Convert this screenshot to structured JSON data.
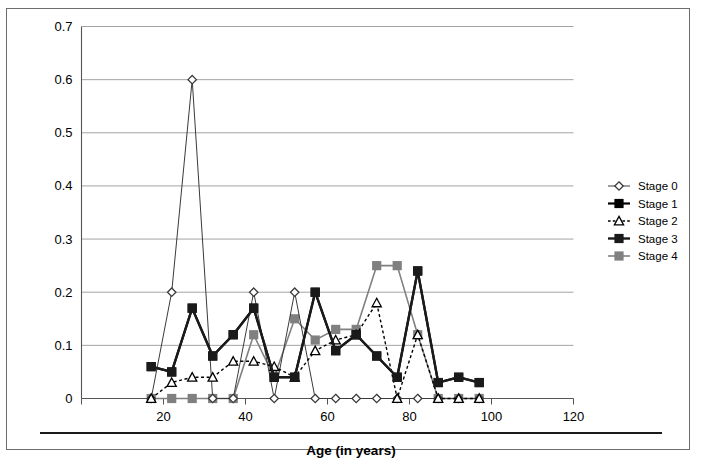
{
  "figure": {
    "background": "#ffffff",
    "border_color": "#6e6e6e"
  },
  "axis_title": "Age (in years)",
  "legend": {
    "position": "right",
    "entries": [
      {
        "label": "Stage 0",
        "marker": "diamond-open",
        "color": "#3a3a3a",
        "line": "solid",
        "width": 1.0
      },
      {
        "label": "Stage 1",
        "marker": "square-filled",
        "color": "#000000",
        "line": "solid",
        "width": 2.2
      },
      {
        "label": "Stage 2",
        "marker": "triangle-open",
        "color": "#000000",
        "line": "dashed",
        "width": 1.4
      },
      {
        "label": "Stage 3",
        "marker": "square-filled",
        "color": "#1a1a1a",
        "line": "solid",
        "width": 2.4
      },
      {
        "label": "Stage 4",
        "marker": "square-filled",
        "color": "#808080",
        "line": "solid",
        "width": 1.6
      }
    ]
  },
  "chart_data": {
    "type": "line",
    "title": "",
    "xlabel": "Age (in years)",
    "ylabel": "",
    "xlim": [
      0,
      120
    ],
    "ylim": [
      0,
      0.7
    ],
    "xticks": [
      0,
      20,
      40,
      60,
      80,
      100,
      120
    ],
    "xtick_labels": [
      "",
      "20",
      "40",
      "60",
      "80",
      "100",
      "120"
    ],
    "yticks": [
      0,
      0.1,
      0.2,
      0.3,
      0.4,
      0.5,
      0.6,
      0.7
    ],
    "ytick_labels": [
      "0",
      "0.1",
      "0.2",
      "0.3",
      "0.4",
      "0.5",
      "0.6",
      "0.7"
    ],
    "grid": "horizontal",
    "grid_color": "#9a9a9a",
    "x": [
      17,
      22,
      27,
      32,
      37,
      42,
      47,
      52,
      57,
      62,
      67,
      72,
      77,
      82,
      87,
      92,
      97
    ],
    "series": [
      {
        "name": "Stage 0",
        "marker": "diamond-open",
        "color": "#3a3a3a",
        "line": "solid",
        "width": 1.0,
        "values": [
          0.0,
          0.2,
          0.6,
          0.0,
          0.0,
          0.2,
          0.0,
          0.2,
          0.0,
          0.0,
          0.0,
          0.0,
          0.0,
          0.0,
          0.0,
          0.0,
          0.0
        ]
      },
      {
        "name": "Stage 1",
        "marker": "square-filled",
        "color": "#000000",
        "line": "solid",
        "width": 2.2,
        "values": [
          0.06,
          0.05,
          0.17,
          0.08,
          0.12,
          0.17,
          0.04,
          0.04,
          0.2,
          0.09,
          0.12,
          0.08,
          0.04,
          0.24,
          0.03,
          0.04,
          0.03
        ]
      },
      {
        "name": "Stage 2",
        "marker": "triangle-open",
        "color": "#000000",
        "line": "dashed",
        "width": 1.4,
        "values": [
          0.0,
          0.03,
          0.04,
          0.04,
          0.07,
          0.07,
          0.06,
          0.04,
          0.09,
          0.11,
          0.12,
          0.18,
          0.0,
          0.12,
          0.0,
          0.0,
          0.0
        ]
      },
      {
        "name": "Stage 3",
        "marker": "square-filled",
        "color": "#1a1a1a",
        "line": "solid",
        "width": 2.4,
        "values": [
          0.06,
          0.05,
          0.17,
          0.08,
          0.12,
          0.17,
          0.04,
          0.04,
          0.2,
          0.09,
          0.12,
          0.08,
          0.04,
          0.24,
          0.03,
          0.04,
          0.03
        ]
      },
      {
        "name": "Stage 4",
        "marker": "square-filled",
        "color": "#808080",
        "line": "solid",
        "width": 1.6,
        "values": [
          0.0,
          0.0,
          0.0,
          0.0,
          0.0,
          0.12,
          0.04,
          0.15,
          0.11,
          0.13,
          0.13,
          0.25,
          0.25,
          0.12,
          0.0,
          0.0,
          0.0
        ]
      }
    ]
  }
}
